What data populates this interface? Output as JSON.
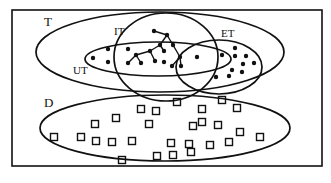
{
  "diagram": {
    "type": "set-venn-diagram",
    "colors": {
      "ink": "#111111",
      "background": "#ffffff"
    },
    "labels": {
      "T": "T",
      "IT": "IT",
      "ET": "ET",
      "UT": "UT",
      "D": "D"
    },
    "sets": [
      {
        "id": "T",
        "shape": "ellipse",
        "cx": 160,
        "cy": 52,
        "rx": 124,
        "ry": 40
      },
      {
        "id": "UT",
        "shape": "ellipse",
        "cx": 158,
        "cy": 59,
        "rx": 73,
        "ry": 17
      },
      {
        "id": "IT",
        "shape": "ellipse",
        "cx": 166,
        "cy": 57,
        "rx": 52,
        "ry": 44
      },
      {
        "id": "ET",
        "shape": "ellipse",
        "cx": 219,
        "cy": 67,
        "rx": 43,
        "ry": 27
      },
      {
        "id": "D",
        "shape": "ellipse",
        "cx": 165,
        "cy": 128,
        "rx": 125,
        "ry": 33
      }
    ],
    "tree": {
      "nodes": [
        [
          154,
          31
        ],
        [
          167,
          35
        ],
        [
          160,
          45
        ],
        [
          173,
          45
        ],
        [
          150,
          51
        ],
        [
          164,
          51
        ],
        [
          136,
          55
        ],
        [
          128,
          63
        ],
        [
          141,
          63
        ],
        [
          155,
          61
        ],
        [
          180,
          57
        ],
        [
          172,
          66
        ],
        [
          181,
          66
        ]
      ],
      "edges": [
        [
          0,
          1
        ],
        [
          1,
          2
        ],
        [
          1,
          3
        ],
        [
          2,
          4
        ],
        [
          2,
          5
        ],
        [
          4,
          6
        ],
        [
          6,
          7
        ],
        [
          6,
          8
        ],
        [
          4,
          9
        ],
        [
          3,
          10
        ],
        [
          10,
          11
        ],
        [
          10,
          12
        ]
      ]
    },
    "dots": [
      [
        93,
        58
      ],
      [
        108,
        49
      ],
      [
        108,
        62
      ],
      [
        128,
        49
      ],
      [
        164,
        62
      ],
      [
        197,
        57
      ],
      [
        222,
        55
      ],
      [
        235,
        48
      ],
      [
        235,
        56
      ],
      [
        246,
        56
      ],
      [
        243,
        64
      ],
      [
        254,
        63
      ],
      [
        232,
        70
      ],
      [
        242,
        72
      ],
      [
        216,
        77
      ],
      [
        229,
        76
      ]
    ],
    "squares": [
      [
        54,
        137
      ],
      [
        81,
        137
      ],
      [
        95,
        124
      ],
      [
        96,
        141
      ],
      [
        116,
        118
      ],
      [
        112,
        142
      ],
      [
        132,
        141
      ],
      [
        122,
        160
      ],
      [
        141,
        109
      ],
      [
        149,
        124
      ],
      [
        156,
        111
      ],
      [
        157,
        156
      ],
      [
        173,
        155
      ],
      [
        177,
        102
      ],
      [
        171,
        143
      ],
      [
        189,
        144
      ],
      [
        193,
        126
      ],
      [
        191,
        152
      ],
      [
        202,
        109
      ],
      [
        202,
        122
      ],
      [
        210,
        145
      ],
      [
        218,
        125
      ],
      [
        222,
        100
      ],
      [
        229,
        142
      ],
      [
        237,
        108
      ],
      [
        240,
        132
      ],
      [
        260,
        137
      ]
    ]
  }
}
